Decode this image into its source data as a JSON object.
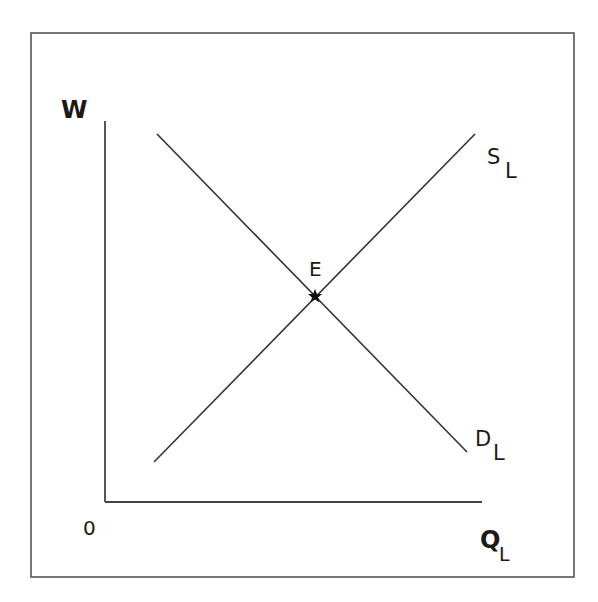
{
  "diagram": {
    "frame": {
      "x1": 31,
      "y1": 33,
      "x2": 574,
      "y2": 577,
      "color": "#555555"
    },
    "axes": {
      "origin": {
        "x": 105,
        "y": 502,
        "label": "0"
      },
      "y_axis": {
        "top_y": 121,
        "label": "W"
      },
      "x_axis": {
        "right_x": 482,
        "label": "Q",
        "label_sub": "L"
      },
      "color": "#444444"
    },
    "curves": [
      {
        "id": "supply",
        "label": "S",
        "label_sub": "L",
        "x1": 154,
        "y1": 462,
        "x2": 475,
        "y2": 134
      },
      {
        "id": "demand",
        "label": "D",
        "label_sub": "L",
        "x1": 157,
        "y1": 134,
        "x2": 467,
        "y2": 452
      }
    ],
    "equilibrium": {
      "label": "E",
      "x": 315,
      "y": 296,
      "marker": "star-icon"
    },
    "line_color": "#333333"
  }
}
